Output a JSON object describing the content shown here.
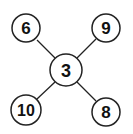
{
  "diagram": {
    "type": "star-graph",
    "center": {
      "label": "3",
      "cx": 66,
      "cy": 70,
      "r": 16
    },
    "nodes": [
      {
        "id": "top-left",
        "label": "6",
        "cx": 26,
        "cy": 28,
        "r": 14
      },
      {
        "id": "top-right",
        "label": "9",
        "cx": 106,
        "cy": 28,
        "r": 14
      },
      {
        "id": "bottom-left",
        "label": "10",
        "cx": 26,
        "cy": 110,
        "r": 15
      },
      {
        "id": "bottom-right",
        "label": "8",
        "cx": 106,
        "cy": 112,
        "r": 14
      }
    ],
    "stroke_color": "#222222",
    "fill_color": "#ffffff"
  }
}
